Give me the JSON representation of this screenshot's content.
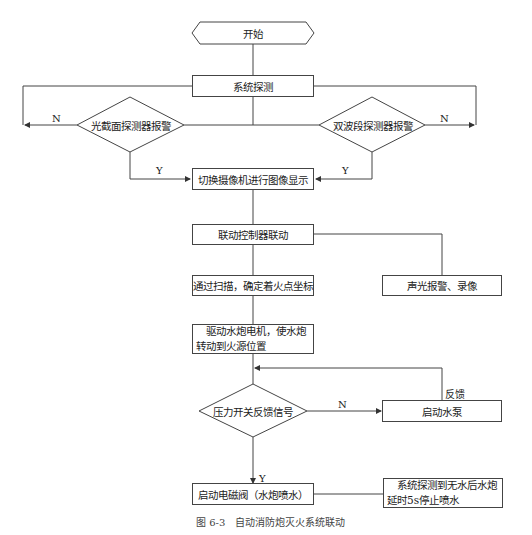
{
  "nodes": {
    "start": "开始",
    "system_detect": "系统探测",
    "decision_left": "光截面探测器报警",
    "decision_right": "双波段探测器报警",
    "switch_camera": "切换摄像机进行图像显示",
    "linkage_controller": "联动控制器联动",
    "scan_coords": "通过扫描，确定着火点坐标",
    "alarm_record": "声光报警、录像",
    "drive_motor": "　驱动水炮电机，使水炮转动到火源位置",
    "pressure_decision": "压力开关反馈信号",
    "start_pump": "启动水泵",
    "solenoid_valve": "启动电磁阀（水炮喷水）",
    "stop_spray": "　系统探测到无水后水炮延时5s停止喷水"
  },
  "labels": {
    "left_n": "N",
    "right_n": "N",
    "left_y": "Y",
    "right_y": "Y",
    "pressure_n": "N",
    "pressure_y": "Y",
    "feedback": "反馈"
  },
  "caption": "图 6-3　自动消防炮灭火系统联动"
}
